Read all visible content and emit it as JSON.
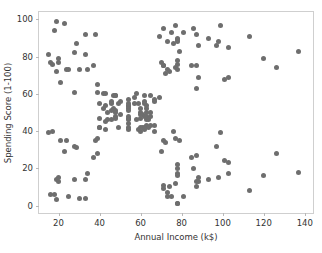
{
  "chart_data": {
    "type": "scatter",
    "title": "",
    "xlabel": "Annual Income (k$)",
    "ylabel": "Spending Score (1-100)",
    "xlim": [
      10.5,
      144
    ],
    "ylim": [
      -4,
      104
    ],
    "xticks": [
      20,
      40,
      60,
      80,
      100,
      120,
      140
    ],
    "yticks": [
      0,
      20,
      40,
      60,
      80,
      100
    ],
    "grid": false,
    "legend": null,
    "marker_color": "#6e6e6e",
    "marker_size_px": 5,
    "frame_color": "#cfcfcf",
    "tick_label_color": "#333333",
    "series": [
      {
        "name": "Customers",
        "x": [
          15,
          15,
          16,
          16,
          17,
          17,
          18,
          18,
          19,
          19,
          19,
          19,
          20,
          20,
          20,
          20,
          21,
          21,
          23,
          23,
          24,
          24,
          25,
          25,
          28,
          28,
          28,
          28,
          29,
          29,
          30,
          30,
          33,
          33,
          33,
          33,
          34,
          34,
          37,
          37,
          38,
          38,
          39,
          39,
          39,
          39,
          40,
          40,
          40,
          40,
          42,
          42,
          43,
          43,
          43,
          43,
          44,
          44,
          46,
          46,
          46,
          46,
          47,
          47,
          48,
          48,
          48,
          48,
          48,
          48,
          49,
          49,
          50,
          50,
          54,
          54,
          54,
          54,
          54,
          54,
          54,
          54,
          54,
          54,
          54,
          54,
          57,
          57,
          58,
          58,
          59,
          59,
          60,
          60,
          60,
          60,
          60,
          60,
          61,
          61,
          62,
          62,
          62,
          62,
          62,
          62,
          63,
          63,
          63,
          63,
          63,
          63,
          64,
          64,
          65,
          65,
          65,
          65,
          67,
          67,
          67,
          67,
          69,
          69,
          70,
          70,
          71,
          71,
          71,
          71,
          71,
          71,
          72,
          72,
          73,
          73,
          73,
          73,
          74,
          74,
          75,
          75,
          76,
          76,
          77,
          77,
          77,
          77,
          78,
          78,
          78,
          78,
          78,
          78,
          78,
          78,
          78,
          78,
          78,
          78,
          79,
          79,
          81,
          81,
          85,
          85,
          86,
          86,
          87,
          87,
          87,
          87,
          87,
          87,
          88,
          88,
          88,
          88,
          93,
          93,
          97,
          97,
          98,
          98,
          99,
          99,
          101,
          101,
          103,
          103,
          103,
          103,
          113,
          113,
          120,
          120,
          126,
          126,
          137,
          137
        ],
        "y": [
          39,
          81,
          6,
          77,
          40,
          76,
          6,
          94,
          3,
          72,
          14,
          99,
          15,
          77,
          13,
          79,
          35,
          66,
          29,
          98,
          35,
          73,
          5,
          73,
          14,
          82,
          32,
          61,
          31,
          87,
          4,
          73,
          4,
          92,
          14,
          81,
          17,
          73,
          26,
          75,
          35,
          92,
          36,
          61,
          28,
          65,
          55,
          47,
          42,
          42,
          52,
          60,
          54,
          60,
          45,
          41,
          50,
          46,
          51,
          46,
          56,
          55,
          52,
          59,
          51,
          59,
          50,
          48,
          59,
          47,
          55,
          42,
          49,
          56,
          47,
          54,
          53,
          48,
          52,
          42,
          51,
          55,
          41,
          44,
          57,
          46,
          58,
          55,
          60,
          46,
          55,
          41,
          49,
          40,
          42,
          52,
          47,
          50,
          42,
          49,
          41,
          48,
          59,
          55,
          56,
          42,
          50,
          46,
          43,
          48,
          52,
          54,
          42,
          46,
          48,
          50,
          43,
          59,
          43,
          57,
          56,
          40,
          58,
          91,
          29,
          77,
          35,
          95,
          11,
          75,
          9,
          75,
          34,
          71,
          5,
          88,
          7,
          73,
          10,
          72,
          5,
          93,
          40,
          87,
          12,
          97,
          36,
          74,
          22,
          90,
          17,
          88,
          20,
          76,
          16,
          89,
          1,
          78,
          1,
          73,
          35,
          83,
          5,
          93,
          26,
          75,
          20,
          95,
          27,
          63,
          13,
          75,
          10,
          92,
          13,
          86,
          15,
          69,
          14,
          90,
          32,
          86,
          15,
          88,
          39,
          97,
          24,
          68,
          17,
          85,
          23,
          69,
          8,
          91,
          16,
          79,
          28,
          74,
          18,
          83
        ]
      }
    ]
  }
}
